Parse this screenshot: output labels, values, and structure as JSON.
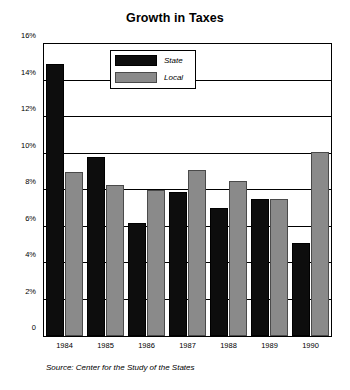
{
  "chart_data": {
    "type": "bar",
    "title": "Growth in Taxes",
    "xlabel": "",
    "ylabel": "",
    "categories": [
      "1984",
      "1985",
      "1986",
      "1987",
      "1988",
      "1989",
      "1990"
    ],
    "series": [
      {
        "name": "State",
        "color": "#0d0d0d",
        "values": [
          14.9,
          9.8,
          6.2,
          7.9,
          7.0,
          7.5,
          5.1
        ]
      },
      {
        "name": "Local",
        "color": "#8a8a8a",
        "values": [
          9.0,
          8.3,
          8.0,
          9.1,
          8.5,
          7.5,
          10.1
        ]
      }
    ],
    "ylim": [
      0,
      16
    ],
    "ytick_values": [
      0,
      2,
      4,
      6,
      8,
      10,
      12,
      14,
      16
    ],
    "ytick_labels": [
      "0",
      "2%",
      "4%",
      "6%",
      "8%",
      "10%",
      "12%",
      "14%",
      "16%"
    ],
    "grid": true,
    "legend_position": "upper-left-inside",
    "source_note": "Source: Center for the Study of the States"
  }
}
